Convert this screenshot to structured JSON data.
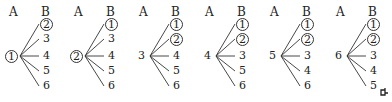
{
  "header_labels": {
    "a": "A",
    "b": "B"
  },
  "trees": [
    {
      "root": "1",
      "root_circled": true,
      "leaves": [
        {
          "v": "2",
          "circled": true
        },
        {
          "v": "3",
          "circled": false
        },
        {
          "v": "4",
          "circled": false
        },
        {
          "v": "5",
          "circled": false
        },
        {
          "v": "6",
          "circled": false
        }
      ]
    },
    {
      "root": "2",
      "root_circled": true,
      "leaves": [
        {
          "v": "1",
          "circled": true
        },
        {
          "v": "3",
          "circled": false
        },
        {
          "v": "4",
          "circled": false
        },
        {
          "v": "5",
          "circled": false
        },
        {
          "v": "6",
          "circled": false
        }
      ]
    },
    {
      "root": "3",
      "root_circled": false,
      "leaves": [
        {
          "v": "1",
          "circled": true
        },
        {
          "v": "2",
          "circled": true
        },
        {
          "v": "4",
          "circled": false
        },
        {
          "v": "5",
          "circled": false
        },
        {
          "v": "6",
          "circled": false
        }
      ]
    },
    {
      "root": "4",
      "root_circled": false,
      "leaves": [
        {
          "v": "1",
          "circled": true
        },
        {
          "v": "2",
          "circled": true
        },
        {
          "v": "3",
          "circled": false
        },
        {
          "v": "5",
          "circled": false
        },
        {
          "v": "6",
          "circled": false
        }
      ]
    },
    {
      "root": "5",
      "root_circled": false,
      "leaves": [
        {
          "v": "1",
          "circled": true
        },
        {
          "v": "2",
          "circled": true
        },
        {
          "v": "3",
          "circled": false
        },
        {
          "v": "4",
          "circled": false
        },
        {
          "v": "6",
          "circled": false
        }
      ]
    },
    {
      "root": "6",
      "root_circled": false,
      "leaves": [
        {
          "v": "1",
          "circled": true
        },
        {
          "v": "2",
          "circled": true
        },
        {
          "v": "3",
          "circled": false
        },
        {
          "v": "4",
          "circled": false
        },
        {
          "v": "5",
          "circled": false
        }
      ]
    }
  ],
  "end_mark": "end-of-proof-mark"
}
